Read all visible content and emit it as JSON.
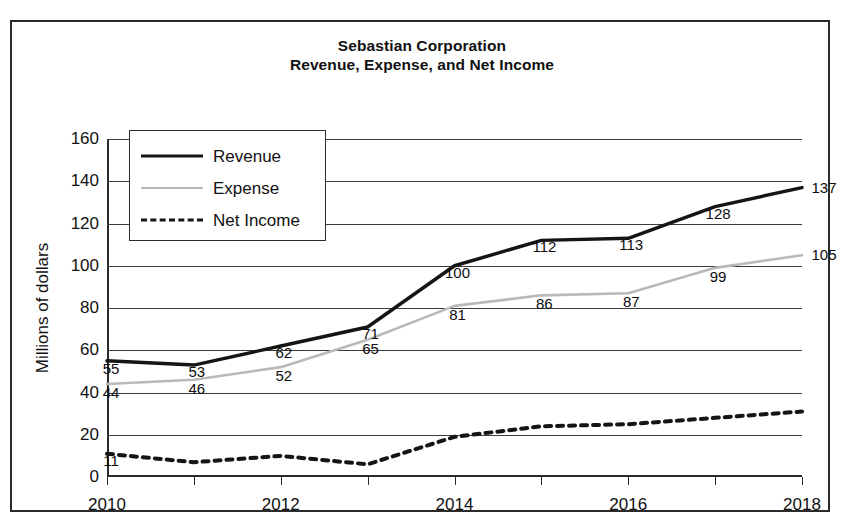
{
  "chart_data": {
    "type": "line",
    "title": "Sebastian Corporation\nRevenue, Expense, and Net Income",
    "title_line1": "Sebastian Corporation",
    "title_line2": "Revenue, Expense, and Net Income",
    "xlabel": "",
    "ylabel": "Millions of dollars",
    "x": [
      2010,
      2011,
      2012,
      2013,
      2014,
      2015,
      2016,
      2017,
      2018
    ],
    "xlim": [
      2010,
      2018
    ],
    "ylim": [
      0,
      160
    ],
    "yticks": [
      0,
      20,
      40,
      60,
      80,
      100,
      120,
      140,
      160
    ],
    "xticks": [
      2010,
      2011,
      2012,
      2013,
      2014,
      2015,
      2016,
      2017,
      2018
    ],
    "xtick_labels_shown": [
      "2010",
      "2012",
      "2014",
      "2016",
      "2018"
    ],
    "grid": true,
    "legend_position": "upper left",
    "series": [
      {
        "name": "Revenue",
        "color": "#151515",
        "style": "solid",
        "values": [
          55,
          53,
          62,
          71,
          100,
          112,
          113,
          128,
          137
        ],
        "labels": [
          "55",
          "53",
          "62",
          "71",
          "100",
          "112",
          "113",
          "128",
          "137"
        ],
        "labels_shown": true
      },
      {
        "name": "Expense",
        "color": "#b9b9b9",
        "style": "solid",
        "values": [
          44,
          46,
          52,
          65,
          81,
          86,
          87,
          99,
          105
        ],
        "labels": [
          "44",
          "46",
          "52",
          "65",
          "81",
          "86",
          "87",
          "99",
          "105"
        ],
        "labels_shown": true
      },
      {
        "name": "Net Income",
        "color": "#151515",
        "style": "dashed",
        "values": [
          11,
          7,
          10,
          6,
          19,
          24,
          25,
          28,
          31
        ],
        "labels": [
          "11",
          "",
          "",
          "",
          "",
          "",
          "",
          "",
          ""
        ],
        "labels_shown": false
      }
    ]
  },
  "legend": {
    "items": [
      {
        "label": "Revenue"
      },
      {
        "label": "Expense"
      },
      {
        "label": "Net Income"
      }
    ]
  },
  "axis": {
    "y_title": "Millions of dollars",
    "y_ticks": [
      "160",
      "140",
      "120",
      "100",
      "80",
      "60",
      "40",
      "20",
      "0"
    ],
    "x_labels": [
      "2010",
      "2012",
      "2014",
      "2016",
      "2018"
    ]
  },
  "colors": {
    "revenue": "#151515",
    "expense": "#b9b9b9",
    "net_income": "#151515",
    "frame": "#2b2b2b",
    "background": "#ffffff"
  }
}
